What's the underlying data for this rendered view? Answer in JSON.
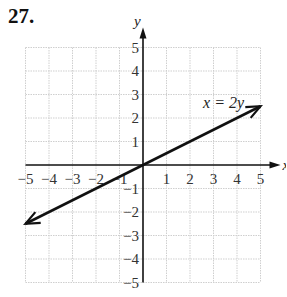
{
  "problem": {
    "number": "27."
  },
  "chart_data": {
    "type": "line",
    "title": "",
    "xlabel": "x",
    "ylabel": "y",
    "xlim": [
      -5,
      5
    ],
    "ylim": [
      -5,
      5
    ],
    "grid": true,
    "x_ticks": [
      "−5",
      "−4",
      "−3",
      "−2",
      "−1",
      "1",
      "2",
      "3",
      "4",
      "5"
    ],
    "y_ticks": [
      "5",
      "4",
      "3",
      "2",
      "1",
      "−1",
      "−2",
      "−3",
      "−4",
      "−5"
    ],
    "series": [
      {
        "name": "x = 2y",
        "x": [
          -5,
          0,
          5
        ],
        "y": [
          -2.5,
          0,
          2.5
        ],
        "arrows": "both"
      }
    ],
    "annotations": [
      {
        "text": "x = 2y",
        "x": 2.6,
        "y": 2.5
      }
    ]
  },
  "colors": {
    "grid": "#cfcfcf",
    "axis": "#111111",
    "line": "#111111"
  }
}
